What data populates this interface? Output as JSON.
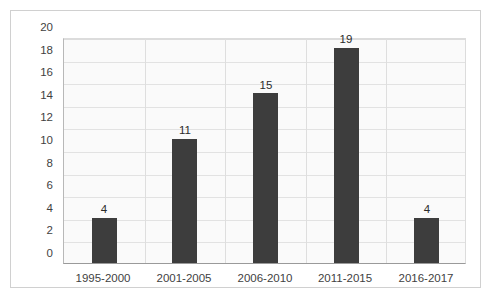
{
  "chart_data": {
    "type": "bar",
    "title": "",
    "subtitle": "",
    "xlabel": "",
    "ylabel": "",
    "categories": [
      "1995-2000",
      "2001-2005",
      "2006-2010",
      "2011-2015",
      "2016-2017"
    ],
    "values": [
      4,
      11,
      15,
      19,
      4
    ],
    "data_labels": [
      "4",
      "11",
      "15",
      "19",
      "4"
    ],
    "ylim": [
      0,
      20
    ],
    "ytick_step": 2,
    "ytick_labels": [
      "0",
      "2",
      "4",
      "6",
      "8",
      "10",
      "12",
      "14",
      "16",
      "18",
      "20"
    ],
    "grid": true,
    "grid_axis": "both",
    "legend": false,
    "legend_position": "none",
    "colors": {
      "bar": "#3d3d3d",
      "plot_background": "#fafafa",
      "gridline": "#e2e2e2",
      "category_line": "#dedede",
      "axis_line": "#9a9a9a",
      "frame_border": "#d0d0d0",
      "page_background": "#ffffff",
      "tick_text": "#3f3f3f",
      "value_text": "#2b2b2b"
    }
  }
}
